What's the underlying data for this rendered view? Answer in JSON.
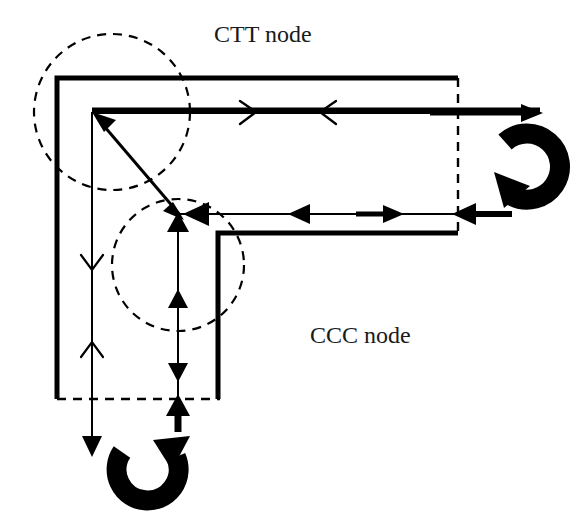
{
  "figure": {
    "type": "diagram",
    "title_visible": false,
    "background_color": "#ffffff",
    "stroke_color": "#000000",
    "text_color": "#1a1a1a",
    "width": 577,
    "height": 514
  },
  "labels": {
    "ctt_node": "CTT node",
    "ccc_node": "CCC node"
  },
  "regions": {
    "ctt_circle": {
      "label": "CTT node",
      "cx": 112,
      "cy": 112,
      "r": 78,
      "style": "dashed-circle"
    },
    "ccc_circle": {
      "label": "CCC node",
      "cx": 178,
      "cy": 265,
      "r": 66,
      "style": "dashed-circle"
    }
  },
  "icons": {
    "right_loop": "curved-loop-arrow-right",
    "bottom_loop": "curved-loop-arrow-bottom",
    "diagonal_arrow": "diagonal-arrow-upleft",
    "chevron_right": "chevron-arrow-right",
    "chevron_left": "chevron-arrow-left",
    "chevron_down": "chevron-arrow-down",
    "chevron_up": "chevron-arrow-up",
    "solid_left": "solid-triangle-arrow-left",
    "solid_right": "solid-triangle-arrow-right",
    "solid_up": "solid-triangle-arrow-up",
    "solid_down": "solid-triangle-arrow-down"
  },
  "geometry": {
    "outer_track_L": {
      "note": "thick outer L path",
      "points": "57,77 458,77"
    },
    "inner_track_L": {
      "note": "thick inner L path",
      "points": "92,110 540,110"
    },
    "lower_track_L": {
      "note": "thick lower L path",
      "points": "218,233 458,233"
    },
    "dashed_vertical_right": {
      "x": 458,
      "y1": 78,
      "y2": 232
    },
    "dashed_horizontal_bottom": {
      "y": 399,
      "x1": 57,
      "x2": 218
    },
    "center_vertical_line": {
      "x": 178,
      "y1": 212,
      "y2": 430
    },
    "left_vertical_line": {
      "x": 92,
      "y1": 112,
      "y2": 455
    },
    "upper_horizontal_line": {
      "y": 110,
      "x1": 92,
      "x2": 540
    },
    "middle_horizontal_line": {
      "y": 213,
      "x1": 172,
      "x2": 520
    }
  }
}
